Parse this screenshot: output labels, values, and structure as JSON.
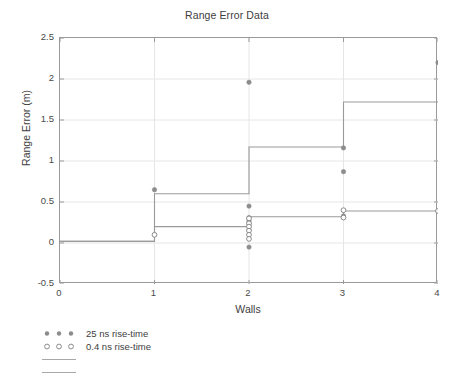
{
  "chart_data": {
    "type": "scatter",
    "title": "Range Error Data",
    "xlabel": "Walls",
    "ylabel": "Range Error (m)",
    "xlim": [
      0,
      4
    ],
    "ylim": [
      -0.5,
      2.5
    ],
    "xticks": [
      0,
      1,
      2,
      3,
      4
    ],
    "xtick_labels": [
      "0",
      "1",
      "2",
      "3",
      "4"
    ],
    "yticks": [
      -0.5,
      0,
      0.5,
      1,
      1.5,
      2,
      2.5
    ],
    "ytick_labels": [
      "-0.5",
      "0",
      "0.5",
      "1",
      "1.5",
      "2",
      "2.5"
    ],
    "grid": true,
    "grid_color": "#e6e6e6",
    "axis_color": "#9a9a9a",
    "legend_position": "below-left",
    "series": [
      {
        "name": "25 ns rise-time",
        "marker": "filled-circle",
        "color": "#8c8c8c",
        "points": [
          {
            "x": 1,
            "y": 0.65
          },
          {
            "x": 2,
            "y": 1.96
          },
          {
            "x": 2,
            "y": 0.45
          },
          {
            "x": 2,
            "y": 0.31
          },
          {
            "x": 2,
            "y": 0.27
          },
          {
            "x": 2,
            "y": 0.24
          },
          {
            "x": 2,
            "y": 0.2
          },
          {
            "x": 2,
            "y": 0.16
          },
          {
            "x": 2,
            "y": -0.05
          },
          {
            "x": 3,
            "y": 1.16
          },
          {
            "x": 3,
            "y": 0.87
          },
          {
            "x": 3,
            "y": 0.33
          },
          {
            "x": 4,
            "y": 2.2
          }
        ]
      },
      {
        "name": "0.4 ns rise-time",
        "marker": "open-circle",
        "color": "#8c8c8c",
        "points": [
          {
            "x": 1,
            "y": 0.1
          },
          {
            "x": 2,
            "y": 0.3
          },
          {
            "x": 2,
            "y": 0.24
          },
          {
            "x": 2,
            "y": 0.2
          },
          {
            "x": 2,
            "y": 0.15
          },
          {
            "x": 2,
            "y": 0.1
          },
          {
            "x": 2,
            "y": 0.05
          },
          {
            "x": 3,
            "y": 0.4
          },
          {
            "x": 3,
            "y": 0.31
          },
          {
            "x": 4,
            "y": 0.39
          }
        ]
      },
      {
        "name": "",
        "marker": "line",
        "color": "#9a9a9a",
        "step_values": [
          {
            "x_from": 0,
            "x_to": 1,
            "y": 0.02
          },
          {
            "x_from": 1,
            "x_to": 2,
            "y": 0.6
          },
          {
            "x_from": 2,
            "x_to": 3,
            "y": 1.17
          },
          {
            "x_from": 3,
            "x_to": 4,
            "y": 1.72
          }
        ]
      },
      {
        "name": "",
        "marker": "line",
        "color": "#9a9a9a",
        "step_values": [
          {
            "x_from": 0,
            "x_to": 1,
            "y": 0.02
          },
          {
            "x_from": 1,
            "x_to": 2,
            "y": 0.2
          },
          {
            "x_from": 2,
            "x_to": 3,
            "y": 0.32
          },
          {
            "x_from": 3,
            "x_to": 4,
            "y": 0.39
          }
        ]
      }
    ]
  },
  "legend": [
    {
      "label": "25 ns rise-time",
      "marker": "filled-circle"
    },
    {
      "label": "0.4 ns rise-time",
      "marker": "open-circle"
    },
    {
      "label": "",
      "marker": "line"
    },
    {
      "label": "",
      "marker": "line"
    }
  ]
}
